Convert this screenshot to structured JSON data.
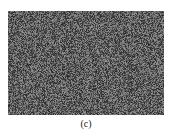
{
  "figure": {
    "caption": "(c)",
    "image": {
      "description": "noise-like encrypted image",
      "mean_gray": "#5a5a5a",
      "dark_gray": "#2e2e2e",
      "light_gray": "#8e8e8e"
    }
  }
}
